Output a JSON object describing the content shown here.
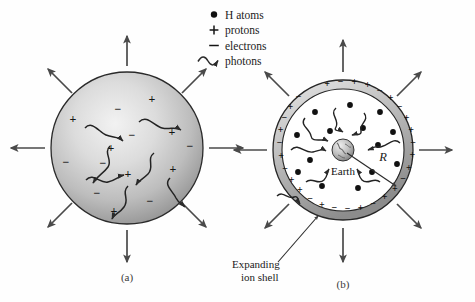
{
  "figure": {
    "title_alt": "Expanding ionized hydrogen shell around Earth",
    "background_color": "#fefefe",
    "ink_color": "#1b1b1b",
    "arrow_color": "#4a4a4a"
  },
  "legend": {
    "items": [
      {
        "symbol": "●",
        "icon": "filled-circle-icon",
        "label": "H atoms"
      },
      {
        "symbol": "+",
        "icon": "plus-sign-icon",
        "label": "protons"
      },
      {
        "symbol": "−",
        "icon": "minus-sign-icon",
        "label": "electrons"
      },
      {
        "symbol": "~",
        "icon": "wavy-arrow-icon",
        "label": "photons"
      }
    ]
  },
  "panel_a": {
    "caption": "(a)",
    "description": "Uniform ionized sphere expanding outward",
    "sphere": {
      "cx": 127,
      "cy": 148,
      "r": 76
    },
    "charges": [
      {
        "sign": "+",
        "x": 152,
        "y": 103
      },
      {
        "sign": "−",
        "x": 118,
        "y": 113
      },
      {
        "sign": "+",
        "x": 73,
        "y": 123
      },
      {
        "sign": "−",
        "x": 132,
        "y": 139
      },
      {
        "sign": "+",
        "x": 172,
        "y": 136
      },
      {
        "sign": "+",
        "x": 111,
        "y": 152
      },
      {
        "sign": "−",
        "x": 66,
        "y": 166
      },
      {
        "sign": "−",
        "x": 103,
        "y": 167
      },
      {
        "sign": "+",
        "x": 128,
        "y": 178
      },
      {
        "sign": "+",
        "x": 173,
        "y": 173
      },
      {
        "sign": "−",
        "x": 97,
        "y": 197
      },
      {
        "sign": "+",
        "x": 114,
        "y": 215
      },
      {
        "sign": "−",
        "x": 150,
        "y": 205
      },
      {
        "sign": "−",
        "x": 190,
        "y": 150
      }
    ],
    "photons": [
      {
        "x1": 85,
        "y1": 128,
        "x2": 124,
        "y2": 142
      },
      {
        "x1": 139,
        "y1": 122,
        "x2": 182,
        "y2": 130
      },
      {
        "x1": 110,
        "y1": 146,
        "x2": 92,
        "y2": 184
      },
      {
        "x1": 154,
        "y1": 153,
        "x2": 135,
        "y2": 186
      },
      {
        "x1": 86,
        "y1": 180,
        "x2": 125,
        "y2": 174
      },
      {
        "x1": 128,
        "y1": 186,
        "x2": 111,
        "y2": 220
      },
      {
        "x1": 170,
        "y1": 178,
        "x2": 186,
        "y2": 208
      }
    ],
    "outward_arrows": [
      {
        "angle": -90
      },
      {
        "angle": -45
      },
      {
        "angle": 0
      },
      {
        "angle": 45
      },
      {
        "angle": 90
      },
      {
        "angle": 135
      },
      {
        "angle": 180
      },
      {
        "angle": -135
      }
    ]
  },
  "panel_b": {
    "caption": "(b)",
    "description": "Expanding ion shell surrounding Earth with neutral H atoms inside",
    "shell": {
      "cx": 343,
      "cy": 150,
      "r_outer": 70,
      "r_inner": 61
    },
    "earth": {
      "cx": 343,
      "cy": 150,
      "r": 11,
      "label": "Earth"
    },
    "radius_marker": {
      "label": "R",
      "x": 383,
      "y": 160
    },
    "annotation": {
      "line1": "Expanding",
      "line2": "ion shell"
    },
    "h_atoms": [
      {
        "x": 315,
        "y": 112
      },
      {
        "x": 350,
        "y": 105
      },
      {
        "x": 380,
        "y": 112
      },
      {
        "x": 297,
        "y": 135
      },
      {
        "x": 330,
        "y": 131
      },
      {
        "x": 363,
        "y": 128
      },
      {
        "x": 393,
        "y": 132
      },
      {
        "x": 378,
        "y": 145
      },
      {
        "x": 310,
        "y": 160
      },
      {
        "x": 397,
        "y": 164
      },
      {
        "x": 322,
        "y": 186
      },
      {
        "x": 358,
        "y": 188
      },
      {
        "x": 372,
        "y": 172
      },
      {
        "x": 298,
        "y": 172
      }
    ],
    "shell_charges": [
      {
        "sign": "+",
        "angle": -104
      },
      {
        "sign": "−",
        "angle": -92
      },
      {
        "sign": "+",
        "angle": -80
      },
      {
        "sign": "+",
        "angle": -68
      },
      {
        "sign": "−",
        "angle": -56
      },
      {
        "sign": "+",
        "angle": -44
      },
      {
        "sign": "−",
        "angle": -32
      },
      {
        "sign": "+",
        "angle": -20
      },
      {
        "sign": "+",
        "angle": -8
      },
      {
        "sign": "−",
        "angle": 4
      },
      {
        "sign": "+",
        "angle": 16
      },
      {
        "sign": "+",
        "angle": 28
      },
      {
        "sign": "−",
        "angle": 40
      },
      {
        "sign": "+",
        "angle": 52
      },
      {
        "sign": "+",
        "angle": 64
      },
      {
        "sign": "−",
        "angle": 76
      },
      {
        "sign": "+",
        "angle": 88
      },
      {
        "sign": "−",
        "angle": 100
      },
      {
        "sign": "−",
        "angle": 112
      },
      {
        "sign": "+",
        "angle": 124
      },
      {
        "sign": "−",
        "angle": 136
      },
      {
        "sign": "+",
        "angle": 148
      },
      {
        "sign": "+",
        "angle": 160
      },
      {
        "sign": "−",
        "angle": 172
      },
      {
        "sign": "+",
        "angle": 184
      },
      {
        "sign": "−",
        "angle": 196
      },
      {
        "sign": "+",
        "angle": 208
      },
      {
        "sign": "−",
        "angle": 220
      },
      {
        "sign": "+",
        "angle": 232
      },
      {
        "sign": "−",
        "angle": 244
      }
    ],
    "photons": [
      {
        "x1": 305,
        "y1": 118,
        "x2": 330,
        "y2": 142
      },
      {
        "x1": 336,
        "y1": 108,
        "x2": 344,
        "y2": 133
      },
      {
        "x1": 364,
        "y1": 113,
        "x2": 352,
        "y2": 136
      },
      {
        "x1": 291,
        "y1": 150,
        "x2": 327,
        "y2": 152
      },
      {
        "x1": 400,
        "y1": 143,
        "x2": 368,
        "y2": 150
      },
      {
        "x1": 306,
        "y1": 182,
        "x2": 329,
        "y2": 168
      },
      {
        "x1": 380,
        "y1": 182,
        "x2": 357,
        "y2": 168
      },
      {
        "x1": 277,
        "y1": 196,
        "x2": 300,
        "y2": 205
      }
    ],
    "outward_arrows": [
      {
        "angle": -90
      },
      {
        "angle": -45
      },
      {
        "angle": 0
      },
      {
        "angle": 45
      },
      {
        "angle": 90
      },
      {
        "angle": 135
      },
      {
        "angle": 180
      },
      {
        "angle": -135
      }
    ]
  }
}
